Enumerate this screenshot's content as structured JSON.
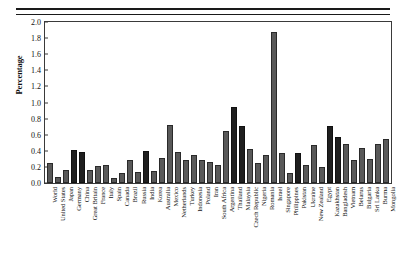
{
  "chart_data": {
    "type": "bar",
    "title": "",
    "xlabel": "",
    "ylabel": "Percentage",
    "ylim": [
      0,
      2.0
    ],
    "ytick_labels": [
      "2.0",
      "1.8",
      "1.6",
      "1.4",
      "1.2",
      "1.0",
      "0.8",
      "0.6",
      "0.4",
      "0.2",
      "0.0"
    ],
    "ytick_values": [
      2.0,
      1.8,
      1.6,
      1.4,
      1.2,
      1.0,
      0.8,
      0.6,
      0.4,
      0.2,
      0.0
    ],
    "grid": false,
    "legend": null,
    "categories": [
      "World",
      "United States",
      "Japan",
      "Germany",
      "China",
      "Great Britain",
      "France",
      "Italy",
      "Spain",
      "Canada",
      "Brazil",
      "Russia",
      "India",
      "Korea",
      "Australia",
      "Mexico",
      "Netherlands",
      "Turkey",
      "Indonesia",
      "Poland",
      "Iran",
      "South Africa",
      "Argentina",
      "Thailand",
      "Malaysia",
      "Czech Republic",
      "Nigeria",
      "Romania",
      "Israel",
      "Singapore",
      "Philippines",
      "Pakistan",
      "Ukraine",
      "New Zealand",
      "Egypt",
      "Kazakhstan",
      "Bangladesh",
      "Vietnam",
      "Belarus",
      "Bulgaria",
      "Sri Lanka",
      "Burma",
      "Mongolia"
    ],
    "values": [
      0.25,
      0.07,
      0.16,
      0.41,
      0.38,
      0.16,
      0.21,
      0.23,
      0.06,
      0.12,
      0.28,
      0.14,
      0.4,
      0.15,
      0.31,
      0.72,
      0.38,
      0.29,
      0.35,
      0.29,
      0.26,
      0.22,
      0.64,
      0.95,
      0.71,
      0.42,
      0.25,
      0.35,
      1.87,
      0.37,
      0.12,
      0.37,
      0.22,
      0.47,
      0.2,
      0.71,
      0.57,
      0.49,
      0.28,
      0.43,
      0.3,
      0.48,
      0.55
    ],
    "bar_shades": [
      "medium",
      "medium",
      "medium",
      "dark",
      "dark",
      "medium",
      "medium",
      "medium",
      "medium",
      "medium",
      "medium",
      "medium",
      "dark",
      "medium",
      "medium",
      "medium",
      "medium",
      "medium",
      "medium",
      "medium",
      "medium",
      "medium",
      "medium",
      "dark",
      "dark",
      "medium",
      "medium",
      "medium",
      "medium",
      "medium",
      "medium",
      "dark",
      "medium",
      "medium",
      "medium",
      "dark",
      "dark",
      "medium",
      "medium",
      "medium",
      "medium",
      "medium",
      "medium"
    ],
    "colors": {
      "bar_medium": "#595959",
      "bar_dark": "#1f1f1f",
      "axis": "#3a3a3a",
      "text": "#111111",
      "background": "#ffffff"
    }
  }
}
